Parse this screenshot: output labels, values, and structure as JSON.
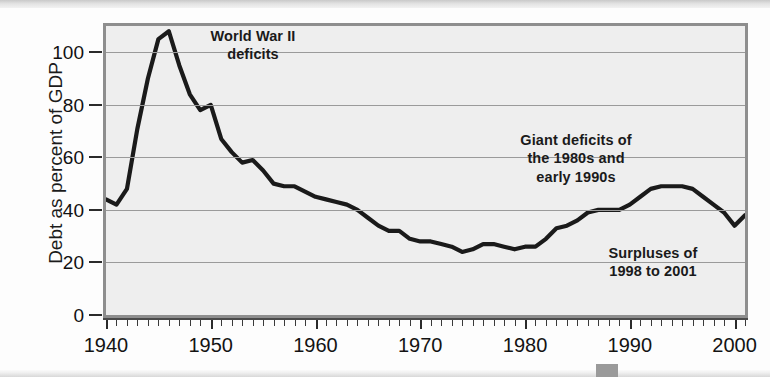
{
  "chart_data": {
    "type": "line",
    "title": "",
    "xlabel": "",
    "ylabel": "Debt as percent of GDP",
    "xlim": [
      1940,
      2001
    ],
    "ylim": [
      0,
      110
    ],
    "y_ticks": [
      0,
      20,
      40,
      60,
      80,
      100
    ],
    "x_ticks": [
      1940,
      1950,
      1960,
      1970,
      1980,
      1990,
      2000
    ],
    "grid": "horizontal",
    "legend": "none",
    "line_color": "#1a1a1a",
    "plot_background": "#eeeeee",
    "series": [
      {
        "name": "Federal debt as percent of GDP",
        "x": [
          1940,
          1941,
          1942,
          1943,
          1944,
          1945,
          1946,
          1947,
          1948,
          1949,
          1950,
          1951,
          1952,
          1953,
          1954,
          1955,
          1956,
          1957,
          1958,
          1959,
          1960,
          1961,
          1962,
          1963,
          1964,
          1965,
          1966,
          1967,
          1968,
          1969,
          1970,
          1971,
          1972,
          1973,
          1974,
          1975,
          1976,
          1977,
          1978,
          1979,
          1980,
          1981,
          1982,
          1983,
          1984,
          1985,
          1986,
          1987,
          1988,
          1989,
          1990,
          1991,
          1992,
          1993,
          1994,
          1995,
          1996,
          1997,
          1998,
          1999,
          2000,
          2001
        ],
        "y": [
          44,
          42,
          48,
          71,
          90,
          105,
          108,
          95,
          84,
          78,
          80,
          67,
          62,
          58,
          59,
          55,
          50,
          49,
          49,
          47,
          45,
          44,
          43,
          42,
          40,
          37,
          34,
          32,
          32,
          29,
          28,
          28,
          27,
          26,
          24,
          25,
          27,
          27,
          26,
          25,
          26,
          26,
          29,
          33,
          34,
          36,
          39,
          40,
          40,
          40,
          42,
          45,
          48,
          49,
          49,
          49,
          48,
          45,
          42,
          39,
          34,
          38
        ],
        "units": "percent of GDP"
      }
    ],
    "annotations": [
      {
        "id": "wwii",
        "text": "World War II\ndeficits",
        "x_ref": 1945,
        "y_ref": 100
      },
      {
        "id": "giant",
        "text": "Giant deficits of\nthe 1980s and\nearly 1990s",
        "x_ref": 1985,
        "y_ref": 66
      },
      {
        "id": "surplus",
        "text": "Surpluses of\n1998 to 2001",
        "x_ref": 1995,
        "y_ref": 27
      }
    ]
  },
  "axes": {
    "y_title": "Debt as percent of GDP",
    "y_tick_labels": [
      "100",
      "80",
      "60",
      "40",
      "20",
      "0"
    ],
    "x_tick_labels": [
      "1940",
      "1950",
      "1960",
      "1970",
      "1980",
      "1990",
      "2000"
    ]
  },
  "annotations": {
    "wwii_line1": "World War II",
    "wwii_line2": "deficits",
    "giant_line1": "Giant deficits of",
    "giant_line2": "the 1980s and",
    "giant_line3": "early 1990s",
    "surplus_line1": "Surpluses of",
    "surplus_line2": "1998 to 2001"
  }
}
